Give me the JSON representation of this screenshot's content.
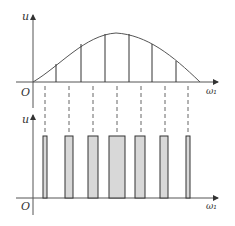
{
  "top_plot": {
    "y_axis_label": "u",
    "x_axis_label": "ω₁",
    "origin_label": "O",
    "curve": "sine half-wave",
    "sample_lines": 6
  },
  "bottom_plot": {
    "y_axis_label": "u",
    "x_axis_label": "ω₁",
    "origin_label": "O",
    "pulses": 7,
    "pulse_widths_relative": [
      1,
      2,
      2.5,
      4,
      2.5,
      2,
      1
    ]
  },
  "projection_lines": 7,
  "colors": {
    "line": "#444444",
    "pulse_fill": "#d8d8d8",
    "dash": "#666666"
  }
}
